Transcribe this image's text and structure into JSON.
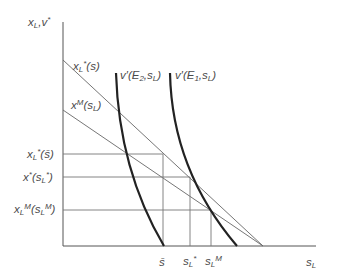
{
  "diagram": {
    "y_axis_label": {
      "base": "x",
      "sub": "L",
      "rest": ",v",
      "sup": "*"
    },
    "x_axis_label": {
      "base": "s",
      "sub": "L"
    },
    "curves": [
      {
        "name": "x_L*(s)",
        "label": {
          "base": "x",
          "sub": "L",
          "sup": "*",
          "rest": "(s)"
        }
      },
      {
        "name": "x^M(s_L)",
        "label": {
          "base": "x",
          "sup": "M",
          "rest": "(s",
          "sub": "L",
          "tail": ")"
        }
      },
      {
        "name": "v'(E2,s_L)",
        "label": {
          "text": "v′(E",
          "sub1": "2",
          "mid": ",s",
          "sub2": "L",
          "tail": ")"
        }
      },
      {
        "name": "v'(E1,s_L)",
        "label": {
          "text": "v′(E",
          "sub1": "1",
          "mid": ",s",
          "sub2": "L",
          "tail": ")"
        }
      }
    ],
    "y_ticks": [
      {
        "name": "x_L*(s-bar)",
        "label": {
          "base": "x",
          "sub": "L",
          "sup": "*",
          "rest": "(s̄)"
        }
      },
      {
        "name": "x*(s_L*)",
        "label": {
          "base": "x",
          "sup": "*",
          "rest": "(s",
          "sub": "L",
          "sup2": "*",
          "tail": ")"
        }
      },
      {
        "name": "x_L^M(s_L^M)",
        "label": {
          "base": "x",
          "sub": "L",
          "sup": "M",
          "rest": "(s",
          "sub2": "L",
          "sup2": "M",
          "tail": ")"
        }
      }
    ],
    "x_ticks": [
      {
        "name": "s-bar",
        "label": "s̄"
      },
      {
        "name": "s_L*",
        "label": {
          "base": "s",
          "sub": "L",
          "sup": "*"
        }
      },
      {
        "name": "s_L^M",
        "label": {
          "base": "s",
          "sub": "L",
          "sup": "M"
        }
      }
    ],
    "colors": {
      "axis": "#555555",
      "thin_line": "#777777",
      "thick_curve": "#222222"
    }
  }
}
